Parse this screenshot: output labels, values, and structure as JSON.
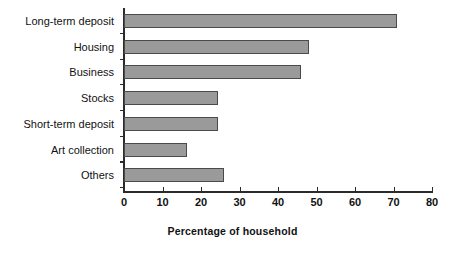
{
  "chart_data": {
    "type": "bar",
    "orientation": "horizontal",
    "title": "",
    "subtitle": "",
    "xlabel": "Percentage of household",
    "ylabel": "",
    "categories": [
      "Long-term deposit",
      "Housing",
      "Business",
      "Stocks",
      "Short-term deposit",
      "Art collection",
      "Others"
    ],
    "values": [
      71,
      48,
      46,
      24.5,
      24.5,
      16.3,
      26
    ],
    "xlim": [
      0,
      80
    ],
    "xticks": [
      0,
      10,
      20,
      30,
      40,
      50,
      60,
      70,
      80
    ],
    "xticklabels": [
      "0",
      "10",
      "20",
      "30",
      "40",
      "50",
      "60",
      "70",
      "80"
    ],
    "grid": false,
    "legend": null,
    "bar_color": "#9a9a9a",
    "bar_edge_color": "#4a4a4a",
    "axis_color": "#2b2b2b",
    "background": "#ffffff"
  }
}
